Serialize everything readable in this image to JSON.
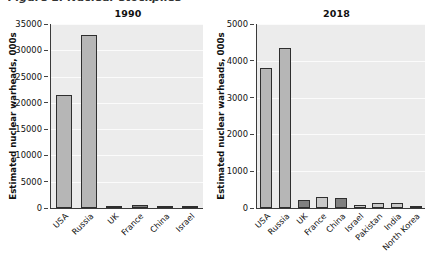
{
  "caption": {
    "clipped_text": "Figure 1: Nuclear stockpiles"
  },
  "chart_data": [
    {
      "type": "bar",
      "title": "1990",
      "xlabel": "",
      "ylabel": "Estimated nuclear warheads, 000s",
      "categories": [
        "USA",
        "Russia",
        "UK",
        "France",
        "China",
        "Israel"
      ],
      "values": [
        21500,
        33000,
        350,
        500,
        430,
        100
      ],
      "shades": [
        "mid",
        "mid",
        "mid",
        "dark",
        "mid",
        "mid"
      ],
      "ylim": [
        0,
        35000
      ],
      "yticks": [
        0,
        5000,
        10000,
        15000,
        20000,
        25000,
        30000,
        35000
      ],
      "grid": true,
      "legend": "none"
    },
    {
      "type": "bar",
      "title": "2018",
      "xlabel": "",
      "ylabel": "Estimated nuclear warheads, 000s",
      "categories": [
        "USA",
        "Russia",
        "UK",
        "France",
        "China",
        "Israel",
        "Pakistan",
        "India",
        "North Korea"
      ],
      "values": [
        3800,
        4350,
        215,
        300,
        270,
        80,
        145,
        135,
        30
      ],
      "shades": [
        "mid",
        "mid",
        "dark",
        "light",
        "dark",
        "light",
        "light",
        "light",
        "light"
      ],
      "ylim": [
        0,
        5000
      ],
      "yticks": [
        0,
        1000,
        2000,
        3000,
        4000,
        5000
      ],
      "grid": true,
      "legend": "none"
    }
  ],
  "colors": {
    "panel_background": "#ececec",
    "gridline": "#fbfbfb",
    "bar_mid": "#b6b6b6",
    "bar_dark": "#7f7f7f",
    "bar_light": "#c9c9c9",
    "bar_outline": "#2e2e2e",
    "axis": "#3a3a3a",
    "text": "#111111",
    "page_background": "#ffffff"
  }
}
